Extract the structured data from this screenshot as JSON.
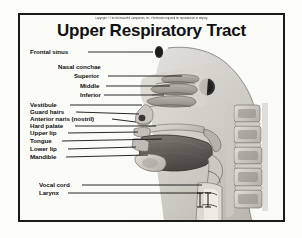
{
  "figure": {
    "title": "Upper Respiratory Tract",
    "copyright": "Copyright © The McGraw-Hill Companies, Inc. Permission required for reproduction or display.",
    "frame_color": "#1a1a1a",
    "background_color": "#fbfbf8",
    "text_color": "#111111",
    "illustration_name": "sagittal-section-head-neck",
    "illustration_style": "grayscale-photographic-cadaver-section"
  },
  "labels": [
    {
      "id": "frontal-sinus",
      "text": "Frontal sinus",
      "x": 10,
      "y": 36,
      "line_to_x": 131,
      "line_to_y": 37
    },
    {
      "id": "nasal-conchae",
      "text": "Nasal conchae",
      "x": 38,
      "y": 51,
      "line_to_x": null,
      "line_to_y": null
    },
    {
      "id": "superior-concha",
      "text": "Superior",
      "x": 54,
      "y": 60,
      "line_to_x": 160,
      "line_to_y": 61
    },
    {
      "id": "middle-concha",
      "text": "Middle",
      "x": 60,
      "y": 70,
      "line_to_x": 147,
      "line_to_y": 71
    },
    {
      "id": "inferior-concha",
      "text": "Inferior",
      "x": 60,
      "y": 79,
      "line_to_x": 141,
      "line_to_y": 80
    },
    {
      "id": "vestibule",
      "text": "Vestibule",
      "x": 10,
      "y": 89,
      "line_to_x": 120,
      "line_to_y": 90
    },
    {
      "id": "guard-hairs",
      "text": "Guard hairs",
      "x": 10,
      "y": 96,
      "line_to_x": 118,
      "line_to_y": 98
    },
    {
      "id": "anterior-naris",
      "text": "Anterior naris (nostril)",
      "x": 10,
      "y": 103,
      "line_to_x": 114,
      "line_to_y": 106
    },
    {
      "id": "hard-palate",
      "text": "Hard palate",
      "x": 10,
      "y": 110,
      "line_to_x": 134,
      "line_to_y": 110
    },
    {
      "id": "upper-lip",
      "text": "Upper lip",
      "x": 10,
      "y": 118,
      "line_to_x": 116,
      "line_to_y": 117
    },
    {
      "id": "tongue",
      "text": "Tongue",
      "x": 10,
      "y": 126,
      "line_to_x": 140,
      "line_to_y": 124
    },
    {
      "id": "lower-lip",
      "text": "Lower lip",
      "x": 10,
      "y": 134,
      "line_to_x": 114,
      "line_to_y": 132
    },
    {
      "id": "mandible",
      "text": "Mandible",
      "x": 10,
      "y": 142,
      "line_to_x": 126,
      "line_to_y": 140
    },
    {
      "id": "vocal-cord",
      "text": "Vocal cord",
      "x": 19,
      "y": 169,
      "line_to_x": 180,
      "line_to_y": 170
    },
    {
      "id": "larynx",
      "text": "Larynx",
      "x": 19,
      "y": 177,
      "line_to_x": 180,
      "line_to_y": 178
    }
  ]
}
